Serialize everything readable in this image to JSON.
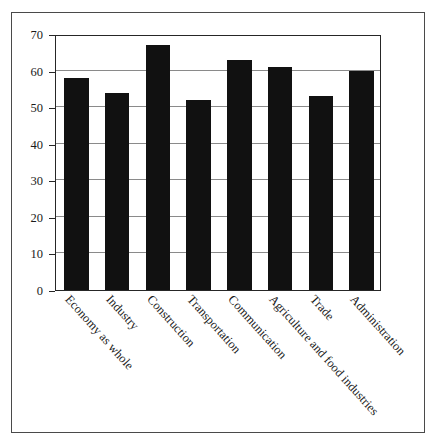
{
  "figure": {
    "background_color": "#ffffff",
    "frame_color": "#4a4a4a",
    "axis_color": "#262626",
    "grid_color": "#8a8a8a",
    "bar_color": "#111111"
  },
  "chart_data": {
    "type": "bar",
    "title": "",
    "subtitle": "",
    "xlabel": "",
    "ylabel": "",
    "categories": [
      "Economy as whole",
      "Industry",
      "Construction",
      "Transportation",
      "Communication",
      "Agriculture and food industries",
      "Trade",
      "Administration"
    ],
    "values": [
      58,
      54,
      67,
      52,
      63,
      61,
      53,
      60
    ],
    "ylim": [
      0,
      70
    ],
    "yticks": [
      0,
      10,
      20,
      30,
      40,
      50,
      60,
      70
    ],
    "ytick_labels": [
      "0",
      "10",
      "20",
      "30",
      "40",
      "50",
      "60",
      "70"
    ],
    "grid": true,
    "grid_axis": "y",
    "legend": false,
    "legend_position": "none",
    "xtick_label_rotation": 48,
    "bar_width_fraction": 0.6,
    "annotations": []
  }
}
